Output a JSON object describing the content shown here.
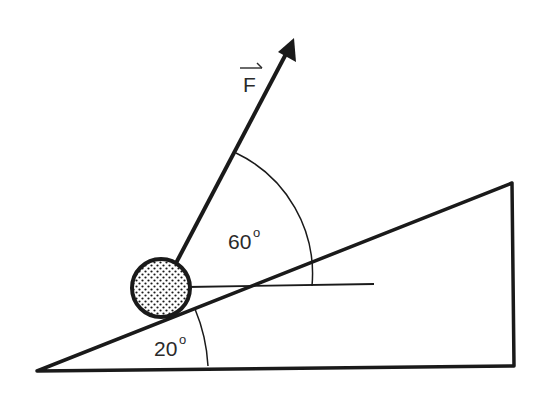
{
  "diagram": {
    "force_label": "F",
    "force_vector_arrow": true,
    "incline_angle_label": "20",
    "incline_angle_deg": 20,
    "force_angle_label": "60",
    "force_angle_deg": 60,
    "degree_symbol": "o",
    "ball_pattern": "dotted",
    "colors": {
      "stroke": "#1a1a1a",
      "background": "#ffffff",
      "text": "#2a2a2a"
    }
  }
}
